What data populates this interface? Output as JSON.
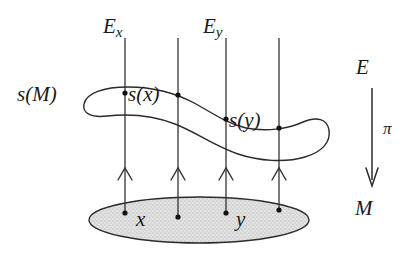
{
  "figure": {
    "type": "fiber-bundle-section-diagram",
    "background_color": "#ffffff",
    "stroke_color": "#1a1a1a",
    "base_fill_color": "#d8d8d8"
  },
  "labels": {
    "fiber_x": {
      "base": "E",
      "sub": "x"
    },
    "fiber_y": {
      "base": "E",
      "sub": "y"
    },
    "section_image": "s(M)",
    "section_at_x": "s(x)",
    "section_at_y": "s(y)",
    "point_x": "x",
    "point_y": "y",
    "total_space": "E",
    "projection": "π",
    "base_space": "M"
  },
  "fibers": [
    {
      "name": "fiber-line-1",
      "x": 125,
      "labeled": true,
      "label": "E_x",
      "has_arrow": true
    },
    {
      "name": "fiber-line-2",
      "x": 178,
      "labeled": false,
      "label": "",
      "has_arrow": true
    },
    {
      "name": "fiber-line-3",
      "x": 226,
      "labeled": true,
      "label": "E_y",
      "has_arrow": true
    },
    {
      "name": "fiber-line-4",
      "x": 279,
      "labeled": false,
      "label": "",
      "has_arrow": true
    }
  ],
  "section_points": [
    {
      "name": "section-point-sx",
      "x": 125,
      "y": 93,
      "label": "s(x)"
    },
    {
      "name": "section-point-unlabeled-1",
      "x": 178,
      "y": 95,
      "label": ""
    },
    {
      "name": "section-point-sy",
      "x": 226,
      "y": 119,
      "label": "s(y)"
    },
    {
      "name": "section-point-unlabeled-2",
      "x": 279,
      "y": 128,
      "label": ""
    }
  ],
  "base_points": [
    {
      "name": "base-point-x",
      "x": 125,
      "y": 213,
      "label": "x"
    },
    {
      "name": "base-point-unlabeled-1",
      "x": 178,
      "y": 217,
      "label": ""
    },
    {
      "name": "base-point-y",
      "x": 226,
      "y": 213,
      "label": "y"
    },
    {
      "name": "base-point-unlabeled-2",
      "x": 279,
      "y": 210,
      "label": ""
    }
  ],
  "projection_arrow": {
    "x": 372,
    "y_start": 88,
    "y_end": 185
  },
  "base_ellipse": {
    "cx": 199,
    "cy": 220,
    "rx": 110,
    "ry": 23
  }
}
